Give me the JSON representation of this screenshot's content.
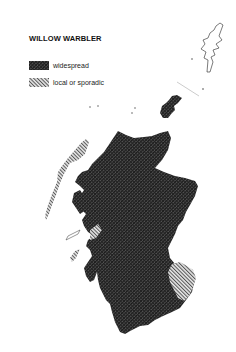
{
  "map": {
    "title": "WILLOW WARBLER",
    "region": "Scotland",
    "legend": [
      {
        "label": "widespread",
        "pattern": "dense-crosshatch",
        "color": "#3a3a3a"
      },
      {
        "label": "local or sporadic",
        "pattern": "diagonal-hatch",
        "color": "#8a8a8a"
      }
    ],
    "areas": [
      {
        "name": "Mainland Scotland",
        "status": "widespread"
      },
      {
        "name": "Orkney",
        "status": "widespread"
      },
      {
        "name": "Outer Hebrides",
        "status": "local or sporadic"
      },
      {
        "name": "Skye",
        "status": "widespread"
      },
      {
        "name": "Southeast Borders",
        "status": "local or sporadic"
      },
      {
        "name": "Shetland",
        "status": "unshaded"
      }
    ]
  }
}
